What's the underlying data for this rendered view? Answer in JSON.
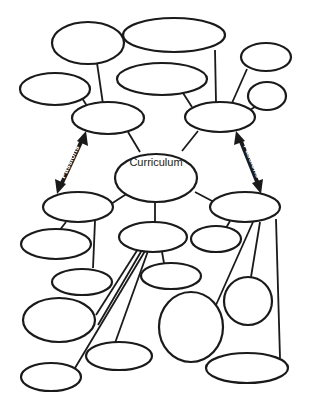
{
  "diagram": {
    "type": "concept-map",
    "center_label": "Curriculum",
    "left_arrow_label": "Passions",
    "right_arrow_label": "Passions",
    "colors": {
      "stroke": "#1a1a1a",
      "fill": "#ffffff",
      "background": "#ffffff"
    },
    "nodes": [
      {
        "id": "center",
        "label": "Curriculum"
      },
      {
        "id": "upper-left-hub",
        "label": ""
      },
      {
        "id": "upper-right-hub",
        "label": ""
      },
      {
        "id": "lower-left-hub",
        "label": ""
      },
      {
        "id": "lower-right-hub",
        "label": ""
      },
      {
        "id": "lower-center-hub",
        "label": ""
      },
      {
        "id": "top-left",
        "label": ""
      },
      {
        "id": "top-center-wide",
        "label": ""
      },
      {
        "id": "mid-left",
        "label": ""
      },
      {
        "id": "mid-center-top",
        "label": ""
      },
      {
        "id": "top-right-small",
        "label": ""
      },
      {
        "id": "right-small",
        "label": ""
      },
      {
        "id": "left-2",
        "label": ""
      },
      {
        "id": "left-3",
        "label": ""
      },
      {
        "id": "left-4",
        "label": ""
      },
      {
        "id": "bottom-left",
        "label": ""
      },
      {
        "id": "center-small-right",
        "label": ""
      },
      {
        "id": "center-below",
        "label": ""
      },
      {
        "id": "bottom-center",
        "label": ""
      },
      {
        "id": "large-circle",
        "label": ""
      },
      {
        "id": "right-circle",
        "label": ""
      },
      {
        "id": "bottom-right",
        "label": ""
      }
    ]
  }
}
